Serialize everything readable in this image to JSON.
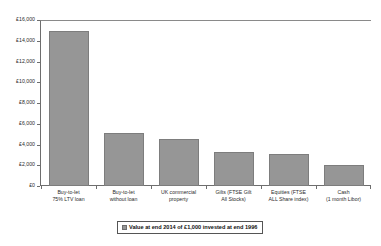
{
  "chart_data": {
    "type": "bar",
    "title": "",
    "subtitle": "",
    "xlabel": "",
    "ylabel": "",
    "ylim": [
      0,
      16000
    ],
    "ytick_step": 2000,
    "grid": false,
    "legend_position": "bottom",
    "currency_symbol": "£",
    "categories": [
      "Buy-to-let\n75% LTV loan",
      "Buy-to-let\nwithout loan",
      "UK commercial\nproperty",
      "Gilts (FTSE Gilt\nAll Stocks)",
      "Equities (FTSE\nALL Share index)",
      "Cash\n(1 month Libor)"
    ],
    "category_lines": [
      [
        "Buy-to-let",
        "75% LTV loan"
      ],
      [
        "Buy-to-let",
        "without loan"
      ],
      [
        "UK commercial",
        "property"
      ],
      [
        "Gilts (FTSE Gilt",
        "All Stocks)"
      ],
      [
        "Equities (FTSE",
        "ALL Share index)"
      ],
      [
        "Cash",
        "(1 month Libor)"
      ]
    ],
    "values": [
      14900,
      5100,
      4500,
      3300,
      3100,
      2000
    ],
    "series": [
      {
        "name": "Value at end 2014 of £1,000 invested at end 1996",
        "values": [
          14900,
          5100,
          4500,
          3300,
          3100,
          2000
        ],
        "color": "#969696"
      }
    ],
    "ytick_labels": [
      "£16,000",
      "£14,000",
      "£12,000",
      "£10,000",
      "£8,000",
      "£6,000",
      "£4,000",
      "£2,000",
      "£0"
    ],
    "ytick_values": [
      16000,
      14000,
      12000,
      10000,
      8000,
      6000,
      4000,
      2000,
      0
    ],
    "legend": [
      {
        "label": "Value at end 2014 of £1,000 invested at end 1996",
        "color": "#969696"
      }
    ]
  },
  "colors": {
    "bar_fill": "#969696",
    "bar_border": "#7d7d7d",
    "axis": "#6e6e6e",
    "text": "#2b2b2b",
    "background": "#ffffff"
  }
}
